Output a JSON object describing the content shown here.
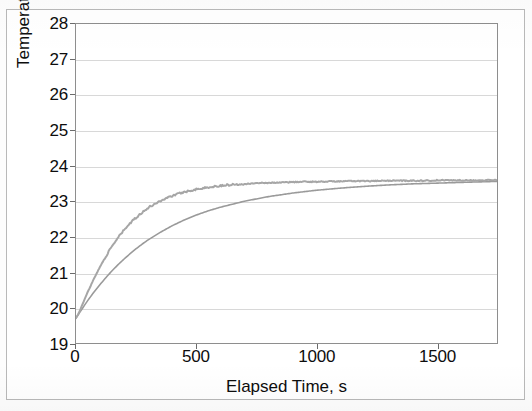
{
  "figure": {
    "background_color": "#ffffff",
    "border_color": "#b9b9b9",
    "axis_color": "#8e8e8e",
    "gridline_color": "#d8d8d8",
    "text_color": "#0d0d0d",
    "data_trace_color": "#a6a6a6",
    "fit_trace_color": "#9a9a9a"
  },
  "chart_data": {
    "type": "line",
    "title": "",
    "xlabel": "Elapsed Time, s",
    "ylabel": "Temperature, °C",
    "xlim": [
      0,
      1750
    ],
    "ylim": [
      19,
      28
    ],
    "xticks": [
      0,
      500,
      1000,
      1500
    ],
    "xtick_labels": [
      "0",
      "500",
      "1000",
      "1500"
    ],
    "yticks": [
      19,
      20,
      21,
      22,
      23,
      24,
      25,
      26,
      27,
      28
    ],
    "ytick_labels": [
      "19",
      "20",
      "21",
      "22",
      "23",
      "24",
      "25",
      "26",
      "27",
      "28"
    ],
    "grid": "horizontal",
    "legend": "none",
    "series": [
      {
        "name": "Measured temperature",
        "style": "noisy-line",
        "color": "#a6a6a6",
        "x": [
          0,
          10,
          20,
          30,
          40,
          50,
          60,
          70,
          80,
          90,
          100,
          120,
          140,
          160,
          180,
          200,
          220,
          240,
          260,
          280,
          300,
          330,
          360,
          390,
          420,
          450,
          480,
          510,
          540,
          570,
          600,
          650,
          700,
          750,
          800,
          850,
          900,
          950,
          1000,
          1050,
          1100,
          1150,
          1200,
          1250,
          1300,
          1350,
          1400,
          1450,
          1500,
          1550,
          1600,
          1650,
          1700,
          1750
        ],
        "y": [
          19.7,
          19.82,
          19.98,
          20.14,
          20.3,
          20.46,
          20.6,
          20.75,
          20.89,
          21.02,
          21.15,
          21.4,
          21.62,
          21.83,
          22.02,
          22.19,
          22.34,
          22.48,
          22.6,
          22.71,
          22.81,
          22.94,
          23.04,
          23.13,
          23.2,
          23.26,
          23.31,
          23.35,
          23.38,
          23.41,
          23.44,
          23.47,
          23.49,
          23.51,
          23.52,
          23.53,
          23.54,
          23.55,
          23.55,
          23.56,
          23.56,
          23.57,
          23.57,
          23.57,
          23.58,
          23.58,
          23.58,
          23.58,
          23.59,
          23.59,
          23.59,
          23.59,
          23.59,
          23.6
        ]
      },
      {
        "name": "Exponential fit",
        "style": "smooth-line",
        "color": "#9a9a9a",
        "x": [
          0,
          25,
          50,
          75,
          100,
          125,
          150,
          175,
          200,
          225,
          250,
          275,
          300,
          350,
          400,
          450,
          500,
          550,
          600,
          700,
          800,
          900,
          1000,
          1100,
          1200,
          1300,
          1400,
          1500,
          1600,
          1700,
          1750
        ],
        "y": [
          19.7,
          19.96,
          20.21,
          20.44,
          20.65,
          20.85,
          21.04,
          21.21,
          21.37,
          21.52,
          21.66,
          21.79,
          21.91,
          22.12,
          22.31,
          22.47,
          22.61,
          22.73,
          22.83,
          23.0,
          23.13,
          23.23,
          23.31,
          23.37,
          23.42,
          23.46,
          23.49,
          23.51,
          23.53,
          23.55,
          23.56
        ]
      }
    ],
    "annotations": {
      "initial_temperature": 19.7,
      "plateau_temperature": 23.6
    }
  }
}
